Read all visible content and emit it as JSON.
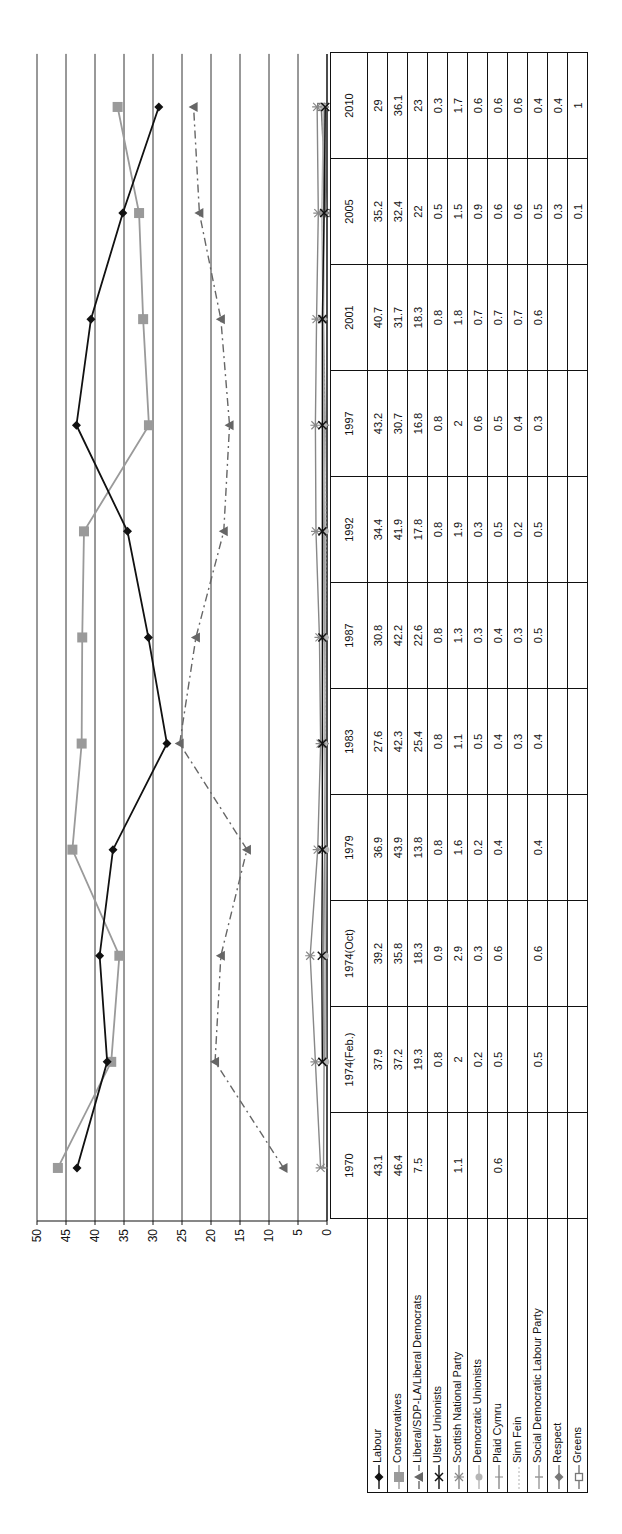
{
  "chart_data": {
    "type": "line",
    "title": "",
    "xlabel": "",
    "ylabel": "",
    "ylim": [
      0,
      50
    ],
    "yticks": [
      0,
      5,
      10,
      15,
      20,
      25,
      30,
      35,
      40,
      45,
      50
    ],
    "grid": true,
    "legend_position": "data-table",
    "orientation": "rotated -90deg (text reads bottom-to-top)",
    "categories": [
      "1970",
      "1974(Feb.)",
      "1974(Oct)",
      "1979",
      "1983",
      "1987",
      "1992",
      "1997",
      "2001",
      "2005",
      "2010"
    ],
    "series": [
      {
        "name": "Labour",
        "color": "#111111",
        "marker": "diamond",
        "dash": "solid",
        "values": [
          43.1,
          37.9,
          39.2,
          36.9,
          27.6,
          30.8,
          34.4,
          43.2,
          40.7,
          35.2,
          29
        ]
      },
      {
        "name": "Conservatives",
        "color": "#9a9a9a",
        "marker": "square",
        "dash": "solid",
        "values": [
          46.4,
          37.2,
          35.8,
          43.9,
          42.3,
          42.2,
          41.9,
          30.7,
          31.7,
          32.4,
          36.1
        ]
      },
      {
        "name": "Liberal/SDP-LA/Liberal Democrats",
        "color": "#666666",
        "marker": "triangle",
        "dash": "dashdot",
        "values": [
          7.5,
          19.3,
          18.3,
          13.8,
          25.4,
          22.6,
          17.8,
          16.8,
          18.3,
          22,
          23
        ]
      },
      {
        "name": "Ulster Unionists",
        "color": "#111111",
        "marker": "x",
        "dash": "solid",
        "values": [
          null,
          0.8,
          0.9,
          0.8,
          0.8,
          0.8,
          0.8,
          0.8,
          0.8,
          0.5,
          0.3
        ]
      },
      {
        "name": "Scottish National Party",
        "color": "#888888",
        "marker": "star",
        "dash": "solid",
        "values": [
          1.1,
          2,
          2.9,
          1.6,
          1.1,
          1.3,
          1.9,
          2,
          1.8,
          1.5,
          1.7
        ]
      },
      {
        "name": "Democratic Unionists",
        "color": "#b5b5b5",
        "marker": "circle",
        "dash": "solid",
        "values": [
          null,
          0.2,
          0.3,
          0.2,
          0.5,
          0.3,
          0.3,
          0.6,
          0.7,
          0.9,
          0.6
        ]
      },
      {
        "name": "Plaid Cymru",
        "color": "#8a8a8a",
        "marker": "plus",
        "dash": "solid",
        "values": [
          0.6,
          0.5,
          0.6,
          0.4,
          0.4,
          0.4,
          0.5,
          0.5,
          0.7,
          0.6,
          0.6
        ]
      },
      {
        "name": "Sinn Fein",
        "color": "#c8c8c8",
        "marker": "none",
        "dash": "dotted",
        "values": [
          null,
          null,
          null,
          null,
          0.3,
          0.3,
          0.2,
          0.4,
          0.7,
          0.6,
          0.6
        ]
      },
      {
        "name": "Social Democratic Labour Party",
        "color": "#999999",
        "marker": "dash",
        "dash": "solid",
        "values": [
          null,
          0.5,
          0.6,
          0.4,
          0.4,
          0.5,
          0.5,
          0.3,
          0.6,
          0.5,
          0.4
        ]
      },
      {
        "name": "Respect",
        "color": "#777777",
        "marker": "diamond",
        "dash": "solid",
        "values": [
          null,
          null,
          null,
          null,
          null,
          null,
          null,
          null,
          null,
          0.3,
          0.4
        ]
      },
      {
        "name": "Greens",
        "color": "#777777",
        "marker": "open-square",
        "dash": "solid",
        "values": [
          null,
          null,
          null,
          null,
          null,
          null,
          null,
          null,
          null,
          0.1,
          1
        ]
      }
    ]
  },
  "table": {
    "rows": [
      {
        "label": "Labour",
        "cells": [
          "43.1",
          "37.9",
          "39.2",
          "36.9",
          "27.6",
          "30.8",
          "34.4",
          "43.2",
          "40.7",
          "35.2",
          "29"
        ]
      },
      {
        "label": "Conservatives",
        "cells": [
          "46.4",
          "37.2",
          "35.8",
          "43.9",
          "42.3",
          "42.2",
          "41.9",
          "30.7",
          "31.7",
          "32.4",
          "36.1"
        ]
      },
      {
        "label": "Liberal/SDP-LA/Liberal Democrats",
        "cells": [
          "7.5",
          "19.3",
          "18.3",
          "13.8",
          "25.4",
          "22.6",
          "17.8",
          "16.8",
          "18.3",
          "22",
          "23"
        ]
      },
      {
        "label": "Ulster Unionists",
        "cells": [
          "",
          "0.8",
          "0.9",
          "0.8",
          "0.8",
          "0.8",
          "0.8",
          "0.8",
          "0.8",
          "0.5",
          "0.3"
        ]
      },
      {
        "label": "Scottish National Party",
        "cells": [
          "1.1",
          "2",
          "2.9",
          "1.6",
          "1.1",
          "1.3",
          "1.9",
          "2",
          "1.8",
          "1.5",
          "1.7"
        ]
      },
      {
        "label": "Democratic Unionists",
        "cells": [
          "",
          "0.2",
          "0.3",
          "0.2",
          "0.5",
          "0.3",
          "0.3",
          "0.6",
          "0.7",
          "0.9",
          "0.6"
        ]
      },
      {
        "label": "Plaid Cymru",
        "cells": [
          "0.6",
          "0.5",
          "0.6",
          "0.4",
          "0.4",
          "0.4",
          "0.5",
          "0.5",
          "0.7",
          "0.6",
          "0.6"
        ]
      },
      {
        "label": "Sinn Fein",
        "cells": [
          "",
          "",
          "",
          "",
          "0.3",
          "0.3",
          "0.2",
          "0.4",
          "0.7",
          "0.6",
          "0.6"
        ]
      },
      {
        "label": "Social Democratic Labour Party",
        "cells": [
          "",
          "0.5",
          "0.6",
          "0.4",
          "0.4",
          "0.5",
          "0.5",
          "0.3",
          "0.6",
          "0.5",
          "0.4"
        ]
      },
      {
        "label": "Respect",
        "cells": [
          "",
          "",
          "",
          "",
          "",
          "",
          "",
          "",
          "",
          "0.3",
          "0.4"
        ]
      },
      {
        "label": "Greens",
        "cells": [
          "",
          "",
          "",
          "",
          "",
          "",
          "",
          "",
          "",
          "0.1",
          "1"
        ]
      }
    ]
  }
}
